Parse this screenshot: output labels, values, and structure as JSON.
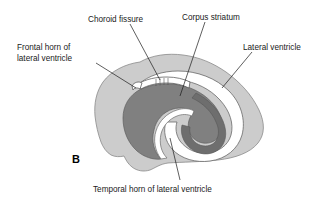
{
  "figure": {
    "panel_letter": "B",
    "background_color": "#ffffff"
  },
  "labels": [
    {
      "id": "choroid-fissure",
      "text": "Choroid fissure",
      "position": "top-center-left"
    },
    {
      "id": "corpus-striatum",
      "text": "Corpus striatum",
      "position": "top-center-right"
    },
    {
      "id": "lateral-ventricle",
      "text": "Lateral ventricle",
      "position": "top-right"
    },
    {
      "id": "frontal-horn-of-lateral-ventricle",
      "text_line_1": "Frontal horn of",
      "text_line_2": "lateral ventricle",
      "position": "left"
    },
    {
      "id": "temporal-horn-of-lateral-ventricle",
      "text": "Temporal horn of lateral ventricle",
      "position": "bottom-center"
    }
  ],
  "anatomy": {
    "cerebral_hemisphere": {
      "name": "cerebral hemisphere outline",
      "fill": "#cccccc",
      "stroke": "#8a8a8a"
    },
    "corpus_striatum": {
      "name": "corpus striatum",
      "fill": "#808080",
      "stroke": "#5f5f5f"
    },
    "ventricle_cavity": {
      "name": "lateral ventricle cavity",
      "fill": "#ffffff",
      "stroke": "#6a6a6a"
    },
    "caudate_tail": {
      "name": "caudate nucleus tail",
      "fill": "#707070"
    },
    "choroid_fissure_band": {
      "name": "choroid fissure",
      "fill": "#ffffff",
      "hatch_color": "#555555"
    }
  }
}
